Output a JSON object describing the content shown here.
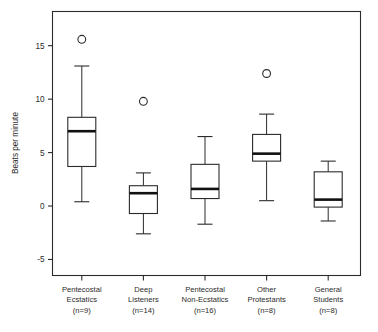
{
  "chart_data": {
    "type": "box",
    "title": "",
    "xlabel": "",
    "ylabel": "Beats per minute",
    "ylim": [
      -6.5,
      18.2
    ],
    "yticks": [
      -5,
      0,
      5,
      10,
      15
    ],
    "ytick_labels": [
      "-5",
      "0",
      "5",
      "10",
      "15"
    ],
    "grid": false,
    "legend": "none",
    "categories": [
      {
        "lines": [
          "Pentecostal",
          "Ecstatics",
          "(n=9)"
        ],
        "n": 9,
        "whisker_low": 0.4,
        "q1": 3.7,
        "median": 7.0,
        "q3": 8.3,
        "whisker_high": 13.1,
        "outliers": [
          15.6
        ]
      },
      {
        "lines": [
          "Deep",
          "Listeners",
          "(n=14)"
        ],
        "n": 14,
        "whisker_low": -2.6,
        "q1": -0.7,
        "median": 1.2,
        "q3": 1.9,
        "whisker_high": 3.1,
        "outliers": [
          9.8
        ]
      },
      {
        "lines": [
          "Pentecostal",
          "Non-Ecstatics",
          "(n=16)"
        ],
        "n": 16,
        "whisker_low": -1.7,
        "q1": 0.7,
        "median": 1.6,
        "q3": 3.9,
        "whisker_high": 6.5,
        "outliers": []
      },
      {
        "lines": [
          "Other",
          "Protestants",
          "(n=8)"
        ],
        "n": 8,
        "whisker_low": 0.5,
        "q1": 4.2,
        "median": 4.9,
        "q3": 6.7,
        "whisker_high": 8.6,
        "outliers": [
          12.4
        ]
      },
      {
        "lines": [
          "General",
          "Students",
          "(n=8)"
        ],
        "n": 8,
        "whisker_low": -1.4,
        "q1": -0.1,
        "median": 0.6,
        "q3": 3.2,
        "whisker_high": 4.2,
        "outliers": []
      }
    ]
  },
  "colors": {
    "axis": "#2b2b2b",
    "median": "#111111",
    "box_fill": "#ffffff",
    "background": "#ffffff"
  }
}
